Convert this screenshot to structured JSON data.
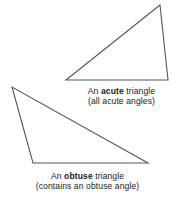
{
  "figure": {
    "background_color": "#ffffff",
    "stroke_color": "#55565a",
    "stroke_width": 1.1,
    "text_color": "#1a1a1a"
  },
  "shapes": [
    {
      "name": "acute-triangle",
      "type": "triangle",
      "classification": "acute",
      "points": "160,5 66,80 168,80"
    },
    {
      "name": "obtuse-triangle",
      "type": "triangle",
      "classification": "obtuse",
      "points": "12,87 33,163 148,163"
    }
  ],
  "captions": {
    "acute": {
      "line1_prefix": "An ",
      "line1_bold": "acute",
      "line1_suffix": " triangle",
      "line2": "(all acute angles)"
    },
    "obtuse": {
      "line1_prefix": "An ",
      "line1_bold": "obtuse",
      "line1_suffix": " triangle",
      "line2": "(contains an obtuse angle)"
    }
  }
}
